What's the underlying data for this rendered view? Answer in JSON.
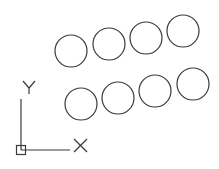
{
  "drawing": {
    "background": "#ffffff",
    "stroke_color": "#3a3a3a",
    "circles_top_row": [
      {
        "cx": 71,
        "cy": 51,
        "r": 16
      },
      {
        "cx": 109,
        "cy": 44,
        "r": 16
      },
      {
        "cx": 146,
        "cy": 38,
        "r": 16
      },
      {
        "cx": 183,
        "cy": 31,
        "r": 16
      }
    ],
    "circles_bottom_row": [
      {
        "cx": 81,
        "cy": 104,
        "r": 16
      },
      {
        "cx": 118,
        "cy": 98,
        "r": 16
      },
      {
        "cx": 155,
        "cy": 91,
        "r": 16
      },
      {
        "cx": 193,
        "cy": 84,
        "r": 16
      }
    ]
  },
  "ucs_icon": {
    "x_label": "X",
    "y_label": "Y"
  }
}
